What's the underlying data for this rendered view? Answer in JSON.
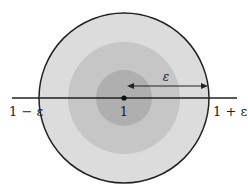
{
  "diagram": {
    "center_label": "1",
    "left_label": "1 − ε",
    "right_label": "1 + ε",
    "radius_label": "ε",
    "colors": {
      "outer_disk": "#dcdcdc",
      "middle_disk": "#c4c4c4",
      "inner_disk": "#acacac",
      "stroke": "#222222"
    }
  }
}
